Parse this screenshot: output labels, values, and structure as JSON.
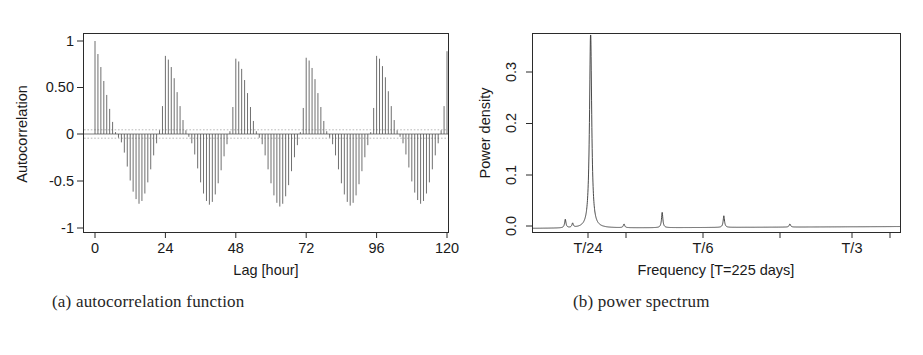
{
  "figure": {
    "panels": [
      {
        "id": "acf",
        "caption": "(a) autocorrelation function"
      },
      {
        "id": "spectrum",
        "caption": "(b) power spectrum"
      }
    ]
  },
  "panel_a": {
    "caption": "(a) autocorrelation function",
    "xlabel": "Lag [hour]",
    "ylabel": "Autocorrelation",
    "xticks": [
      "0",
      "24",
      "48",
      "72",
      "96",
      "120"
    ],
    "yticks": [
      "1",
      "0.50",
      "0",
      "-0.5",
      "-1"
    ]
  },
  "panel_b": {
    "caption": "(b) power spectrum",
    "xlabel": "Frequency [T=225 days]",
    "ylabel": "Power density",
    "xticks": [
      "T/24",
      "T/6",
      "T/3"
    ],
    "yticks": [
      "0.0",
      "0.1",
      "0.2",
      "0.3"
    ]
  },
  "colors": {
    "axis": "#2b2b2b",
    "stem": "#4a4a4a",
    "spectrum_line": "#353535",
    "confidence": "#9a9a9a",
    "background": "#ffffff"
  },
  "chart_data": [
    {
      "type": "bar",
      "id": "autocorrelation-function",
      "title": "(a) autocorrelation function",
      "xlabel": "Lag [hour]",
      "ylabel": "Autocorrelation",
      "xlim": [
        -2,
        122
      ],
      "ylim": [
        -1.0,
        1.05
      ],
      "xticks": [
        0,
        24,
        48,
        72,
        96,
        120
      ],
      "xticklabels": [
        "0",
        "24",
        "48",
        "72",
        "96",
        "120"
      ],
      "yticks": [
        1,
        0.5,
        0,
        -0.5,
        -1
      ],
      "yticklabels": [
        "1",
        "0.50",
        "0",
        "-0.5",
        "-1"
      ],
      "grid": false,
      "legend": null,
      "description": "Damped periodic autocorrelation of an hourly series; dominant 24-hour period, envelope decays within each day and recovers at multiples of 24 h.",
      "confidence_band": [
        0.045,
        -0.045
      ],
      "series_note": "values are lag-by-lag autocorrelation r(k) for k = 0..120 hours",
      "x": [
        0,
        1,
        2,
        3,
        4,
        5,
        6,
        7,
        8,
        9,
        10,
        11,
        12,
        13,
        14,
        15,
        16,
        17,
        18,
        19,
        20,
        21,
        22,
        23,
        24,
        25,
        26,
        27,
        28,
        29,
        30,
        31,
        32,
        33,
        34,
        35,
        36,
        37,
        38,
        39,
        40,
        41,
        42,
        43,
        44,
        45,
        46,
        47,
        48,
        49,
        50,
        51,
        52,
        53,
        54,
        55,
        56,
        57,
        58,
        59,
        60,
        61,
        62,
        63,
        64,
        65,
        66,
        67,
        68,
        69,
        70,
        71,
        72,
        73,
        74,
        75,
        76,
        77,
        78,
        79,
        80,
        81,
        82,
        83,
        84,
        85,
        86,
        87,
        88,
        89,
        90,
        91,
        92,
        93,
        94,
        95,
        96,
        97,
        98,
        99,
        100,
        101,
        102,
        103,
        104,
        105,
        106,
        107,
        108,
        109,
        110,
        111,
        112,
        113,
        114,
        115,
        116,
        117,
        118,
        119,
        120
      ],
      "values": [
        1.0,
        0.86,
        0.72,
        0.57,
        0.42,
        0.27,
        0.13,
        0.02,
        -0.04,
        -0.09,
        -0.2,
        -0.35,
        -0.5,
        -0.62,
        -0.7,
        -0.75,
        -0.72,
        -0.64,
        -0.52,
        -0.38,
        -0.23,
        -0.1,
        0.04,
        0.3,
        0.84,
        0.8,
        0.72,
        0.6,
        0.45,
        0.3,
        0.15,
        0.04,
        -0.03,
        -0.1,
        -0.22,
        -0.37,
        -0.52,
        -0.64,
        -0.72,
        -0.76,
        -0.73,
        -0.65,
        -0.53,
        -0.39,
        -0.24,
        -0.11,
        0.03,
        0.29,
        0.81,
        0.78,
        0.7,
        0.58,
        0.44,
        0.29,
        0.14,
        0.03,
        -0.04,
        -0.11,
        -0.23,
        -0.38,
        -0.53,
        -0.66,
        -0.74,
        -0.78,
        -0.75,
        -0.67,
        -0.55,
        -0.4,
        -0.25,
        -0.12,
        0.02,
        0.28,
        0.82,
        0.79,
        0.71,
        0.59,
        0.44,
        0.29,
        0.14,
        0.03,
        -0.04,
        -0.11,
        -0.23,
        -0.38,
        -0.53,
        -0.65,
        -0.73,
        -0.77,
        -0.74,
        -0.66,
        -0.54,
        -0.4,
        -0.25,
        -0.12,
        0.02,
        0.28,
        0.84,
        0.81,
        0.73,
        0.61,
        0.46,
        0.3,
        0.15,
        0.04,
        -0.03,
        -0.1,
        -0.22,
        -0.36,
        -0.51,
        -0.63,
        -0.71,
        -0.75,
        -0.72,
        -0.64,
        -0.52,
        -0.38,
        -0.23,
        -0.1,
        0.04,
        0.3,
        0.89
      ]
    },
    {
      "type": "line",
      "id": "power-spectrum",
      "title": "(b) power spectrum",
      "xlabel": "Frequency [T=225 days]",
      "ylabel": "Power density",
      "xlim": [
        0,
        1.0
      ],
      "ylim": [
        0.0,
        0.375
      ],
      "xticks_positions": [
        0.155,
        0.46,
        0.92
      ],
      "xticklabels": [
        "T/24",
        "T/6",
        "T/3"
      ],
      "yticks": [
        0.0,
        0.1,
        0.2,
        0.3
      ],
      "yticklabels": [
        "0.0",
        "0.1",
        "0.2",
        "0.3"
      ],
      "grid": false,
      "legend": null,
      "description": "Power spectral density showing a single dominant diurnal peak at T/24 reaching about 0.37, with small harmonic peaks near T/12, T/8 and T/6 and a near-zero broadband floor.",
      "peaks": [
        {
          "label": "minor",
          "x": 0.088,
          "height": 0.016
        },
        {
          "label": "minor",
          "x": 0.108,
          "height": 0.008
        },
        {
          "label": "T/24 diurnal",
          "x": 0.157,
          "height": 0.372
        },
        {
          "label": "minor",
          "x": 0.248,
          "height": 0.007
        },
        {
          "label": "harmonic",
          "x": 0.352,
          "height": 0.029
        },
        {
          "label": "harmonic",
          "x": 0.52,
          "height": 0.022
        },
        {
          "label": "minor",
          "x": 0.7,
          "height": 0.006
        }
      ],
      "baseline": 0.004
    }
  ]
}
